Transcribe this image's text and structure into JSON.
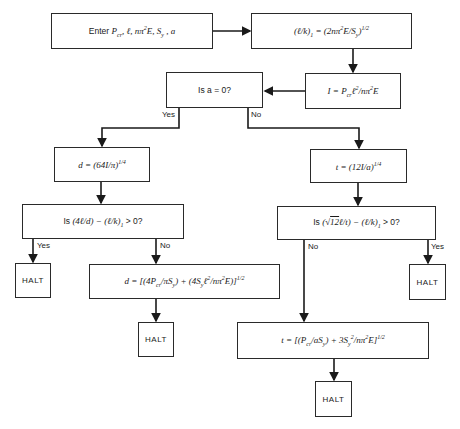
{
  "diagram": {
    "type": "flowchart",
    "nodes": {
      "input": {
        "text": "Enter P_cr, ℓ, nπ²E, S_y, a",
        "prefix": "Enter",
        "html_expr": "P<sub>cr</sub>, ℓ, nπ<sup>2</sup>E, S<sub>y</sub> , a"
      },
      "slenderness": {
        "text": "(ℓ/k)₁ = (2nπ²E/S_y)^1/2"
      },
      "inertia": {
        "text": "I = P_cr ℓ²/nπ²E"
      },
      "decision_a": {
        "text": "Is a = 0?"
      },
      "d_initial": {
        "text": "d = (64I/π)^1/4"
      },
      "t_initial": {
        "text": "t = (12I/a)^1/4"
      },
      "decision_d": {
        "text": "Is (4ℓ/d) − (ℓ/k)₁ > 0?"
      },
      "decision_t": {
        "text": "Is (√12ℓ/t) − (ℓ/k)₁ > 0?"
      },
      "d_johnson": {
        "text": "d = [(4P_cr/πS_y) + (4S_y ℓ²/nπ²E)]^1/2"
      },
      "t_johnson": {
        "text": "t = [(P_cr/aS_y) + 3S_y²/nπ²E]^1/2"
      },
      "halt_1": {
        "text": "HALT"
      },
      "halt_2": {
        "text": "HALT"
      },
      "halt_3": {
        "text": "HALT"
      },
      "halt_4": {
        "text": "HALT"
      }
    },
    "labels": {
      "a_yes": "Yes",
      "a_no": "No",
      "d_yes": "Yes",
      "d_no": "No",
      "t_no": "No",
      "t_yes": "Yes"
    },
    "edges": [
      [
        "input",
        "slenderness"
      ],
      [
        "slenderness",
        "inertia"
      ],
      [
        "inertia",
        "decision_a"
      ],
      [
        "decision_a",
        "d_initial",
        "Yes"
      ],
      [
        "decision_a",
        "t_initial",
        "No"
      ],
      [
        "d_initial",
        "decision_d"
      ],
      [
        "t_initial",
        "decision_t"
      ],
      [
        "decision_d",
        "halt_1",
        "Yes"
      ],
      [
        "decision_d",
        "d_johnson",
        "No"
      ],
      [
        "d_johnson",
        "halt_2"
      ],
      [
        "decision_t",
        "halt_3",
        "Yes"
      ],
      [
        "decision_t",
        "t_johnson",
        "No"
      ],
      [
        "t_johnson",
        "halt_4"
      ]
    ],
    "colors": {
      "line": "#1a1a1a",
      "background": "#ffffff"
    }
  }
}
